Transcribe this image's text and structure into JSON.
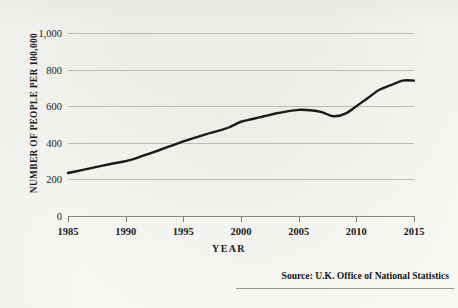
{
  "figure": {
    "source_note": "Source: U.K. Office of National Statistics",
    "background_color": "#f7f7f4",
    "line_color": "#1a1a1a",
    "grid_color": "#bdbdb8"
  },
  "chart_data": {
    "type": "line",
    "title": "",
    "subtitle": "",
    "xlabel": "YEAR",
    "ylabel": "NUMBER OF PEOPLE PER 100,000",
    "xlim": [
      1985,
      2015
    ],
    "ylim": [
      0,
      1000
    ],
    "grid": true,
    "legend": "none",
    "x_tick_labels": [
      "1985",
      "1990",
      "1995",
      "2000",
      "2005",
      "2010",
      "2015"
    ],
    "x_ticks": [
      1985,
      1990,
      1995,
      2000,
      2005,
      2010,
      2015
    ],
    "y_tick_labels": [
      "0",
      "200",
      "400",
      "600",
      "800",
      "1,000"
    ],
    "y_ticks": [
      0,
      200,
      400,
      600,
      800,
      1000
    ],
    "annotations": [
      "Source: U.K. Office of National Statistics"
    ],
    "series": [
      {
        "name": "Number of people per 100,000",
        "x": [
          1985,
          1986,
          1987,
          1988,
          1989,
          1990,
          1991,
          1992,
          1993,
          1994,
          1995,
          1996,
          1997,
          1998,
          1999,
          2000,
          2001,
          2002,
          2003,
          2004,
          2005,
          2006,
          2007,
          2008,
          2009,
          2010,
          2011,
          2012,
          2013,
          2014,
          2015
        ],
        "values": [
          235,
          248,
          262,
          275,
          288,
          300,
          318,
          340,
          362,
          385,
          408,
          428,
          447,
          465,
          485,
          515,
          530,
          545,
          560,
          572,
          580,
          578,
          568,
          545,
          558,
          600,
          645,
          690,
          715,
          740,
          740
        ]
      }
    ]
  }
}
